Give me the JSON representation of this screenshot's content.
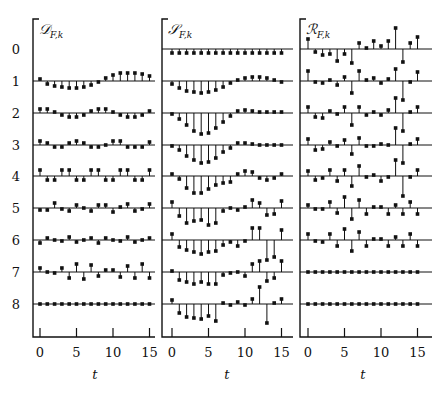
{
  "chart_data": {
    "type": "stem",
    "layout": "three panels side by side, 9 rows (k = 0..8) each, shared x axis t",
    "row_labels": [
      "0",
      "1",
      "2",
      "3",
      "4",
      "5",
      "6",
      "7",
      "8"
    ],
    "xlabel": "t",
    "xticks": [
      0,
      5,
      10,
      15
    ],
    "x": [
      0,
      1,
      2,
      3,
      4,
      5,
      6,
      7,
      8,
      9,
      10,
      11,
      12,
      13,
      14,
      15
    ],
    "panels": [
      {
        "title": "D",
        "subscript": "F,k",
        "rows": [
          null,
          [
            2,
            -3,
            -5,
            -6,
            -7,
            -7,
            -6,
            -4,
            -1,
            3,
            6,
            8,
            8,
            8,
            7,
            5
          ],
          [
            4,
            4,
            1,
            -2,
            -4,
            -4,
            -2,
            2,
            4,
            4,
            1,
            -2,
            -4,
            -4,
            -2,
            2
          ],
          [
            4,
            2,
            -2,
            -2,
            2,
            4,
            2,
            -2,
            -2,
            0,
            4,
            4,
            -2,
            -2,
            -2,
            3
          ],
          [
            6,
            -4,
            -4,
            6,
            6,
            -4,
            -4,
            6,
            6,
            -4,
            -4,
            6,
            6,
            -4,
            -4,
            6
          ],
          [
            -2,
            -2,
            5,
            -1,
            -3,
            3,
            0,
            -3,
            3,
            3,
            -4,
            1,
            4,
            -3,
            -1,
            4
          ],
          [
            -3,
            2,
            0,
            -1,
            3,
            -2,
            0,
            2,
            -3,
            2,
            0,
            -1,
            3,
            -2,
            0,
            2
          ],
          [
            4,
            0,
            -1,
            4,
            -6,
            8,
            -7,
            7,
            -4,
            2,
            2,
            -5,
            6,
            -6,
            8,
            -6
          ],
          [
            0,
            0,
            0,
            0,
            0,
            0,
            0,
            0,
            0,
            0,
            0,
            0,
            0,
            0,
            0,
            0
          ]
        ]
      },
      {
        "title": "S",
        "subscript": "F,k",
        "rows": [
          [
            -4,
            -4,
            -4,
            -4,
            -4,
            -4,
            -4,
            -4,
            -4,
            -4,
            -4,
            -4,
            -4,
            -4,
            -4,
            -4
          ],
          [
            -3,
            -7,
            -10,
            -11,
            -12,
            -11,
            -9,
            -6,
            -2,
            1,
            3,
            4,
            4,
            3,
            1,
            -1
          ],
          [
            -1,
            -6,
            -12,
            -18,
            -21,
            -20,
            -15,
            -9,
            -3,
            2,
            3,
            2,
            1,
            1,
            1,
            1
          ],
          [
            -1,
            -5,
            -11,
            -15,
            -18,
            -17,
            -13,
            -7,
            -3,
            2,
            2,
            1,
            0,
            0,
            0,
            0
          ],
          [
            2,
            -3,
            -12,
            -17,
            -17,
            -13,
            -9,
            -7,
            -6,
            2,
            5,
            4,
            -2,
            -4,
            -2,
            2
          ],
          [
            6,
            -8,
            -15,
            -13,
            -12,
            -17,
            -15,
            -3,
            0,
            -2,
            1,
            8,
            5,
            -7,
            -6,
            7
          ],
          [
            6,
            -7,
            -10,
            -12,
            -14,
            -12,
            -11,
            -5,
            -2,
            -6,
            -1,
            12,
            12,
            -20,
            -17,
            10
          ],
          [
            1,
            -8,
            -10,
            -12,
            -10,
            -12,
            -12,
            -3,
            -1,
            0,
            -4,
            8,
            11,
            -9,
            -6,
            11
          ],
          [
            4,
            -9,
            -13,
            -14,
            -15,
            -12,
            -17,
            1,
            -1,
            2,
            -1,
            5,
            17,
            -19,
            1,
            5
          ]
        ]
      },
      {
        "title": "R",
        "subscript": "F,k",
        "rows": [
          [
            10,
            -3,
            -6,
            -5,
            -12,
            -5,
            -14,
            6,
            1,
            8,
            3,
            8,
            21,
            -13,
            6,
            12
          ],
          [
            10,
            -1,
            -2,
            1,
            -4,
            4,
            -12,
            10,
            1,
            3,
            -2,
            2,
            12,
            -19,
            -1,
            9
          ],
          [
            6,
            -4,
            -5,
            2,
            -1,
            6,
            -12,
            6,
            -2,
            1,
            -2,
            3,
            15,
            -18,
            1,
            6
          ],
          [
            6,
            -5,
            -4,
            3,
            -1,
            5,
            -9,
            7,
            -1,
            -1,
            1,
            0,
            17,
            -18,
            1,
            6
          ],
          [
            5,
            -4,
            -2,
            6,
            -5,
            6,
            -10,
            10,
            -1,
            1,
            -5,
            -1,
            16,
            -20,
            -1,
            6
          ],
          [
            3,
            -1,
            -1,
            6,
            -5,
            11,
            -11,
            8,
            -6,
            1,
            1,
            -6,
            3,
            -6,
            6,
            -6
          ],
          [
            6,
            -1,
            -2,
            6,
            -6,
            11,
            -11,
            8,
            -6,
            1,
            1,
            -6,
            3,
            -6,
            6,
            -6
          ],
          [
            0,
            0,
            0,
            0,
            0,
            0,
            0,
            0,
            0,
            0,
            0,
            0,
            0,
            0,
            0,
            0
          ],
          [
            0,
            0,
            0,
            0,
            0,
            0,
            0,
            0,
            0,
            0,
            0,
            0,
            0,
            0,
            0,
            0
          ]
        ]
      }
    ],
    "value_units": "relative pixels (positive = above baseline)",
    "grid": false,
    "legend": null
  },
  "labels": {
    "rows": [
      "0",
      "1",
      "2",
      "3",
      "4",
      "5",
      "6",
      "7",
      "8"
    ],
    "xlabel": "t",
    "xticks": [
      "0",
      "5",
      "10",
      "15"
    ],
    "panel_titles": [
      "D",
      "S",
      "R"
    ],
    "panel_subscript": "F,k"
  }
}
